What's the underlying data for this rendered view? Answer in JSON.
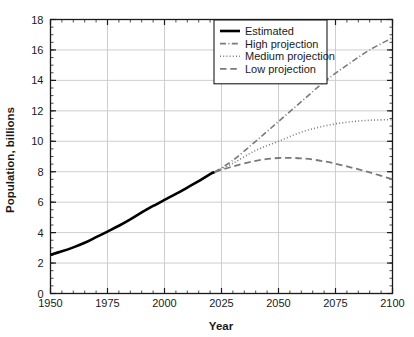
{
  "chart_data": {
    "type": "line",
    "title": "",
    "xlabel": "Year",
    "ylabel": "Population, billions",
    "xlim": [
      1950,
      2100
    ],
    "ylim": [
      0,
      18
    ],
    "xticks": [
      1950,
      1975,
      2000,
      2025,
      2050,
      2075,
      2100
    ],
    "xtick_labels": [
      "1950",
      "1975",
      "2000",
      "2025",
      "2050",
      "2075",
      "2100"
    ],
    "xminor_step": 5,
    "yticks": [
      0,
      2,
      4,
      6,
      8,
      10,
      12,
      14,
      16,
      18
    ],
    "ytick_labels": [
      "0",
      "2",
      "4",
      "6",
      "8",
      "10",
      "12",
      "14",
      "16",
      "18"
    ],
    "yminor_step": 0.5,
    "grid": true,
    "grid_color": "#c8c8c8",
    "legend_position": "top-center-right",
    "series": [
      {
        "name": "Estimated",
        "style": "solid",
        "color": "#000000",
        "width": 2.6,
        "x": [
          1950,
          1955,
          1960,
          1965,
          1970,
          1975,
          1980,
          1985,
          1990,
          1995,
          2000,
          2005,
          2010,
          2015,
          2020,
          2022
        ],
        "values": [
          2.54,
          2.77,
          3.03,
          3.33,
          3.7,
          4.07,
          4.45,
          4.87,
          5.33,
          5.75,
          6.15,
          6.54,
          6.96,
          7.38,
          7.84,
          7.98
        ]
      },
      {
        "name": "High projection",
        "style": "dashdot",
        "color": "#7a7a7a",
        "width": 1.6,
        "x": [
          2022,
          2030,
          2040,
          2050,
          2060,
          2070,
          2080,
          2090,
          2100
        ],
        "values": [
          7.98,
          8.75,
          10.0,
          11.3,
          12.6,
          13.9,
          15.0,
          16.0,
          16.8
        ]
      },
      {
        "name": "Medium projection",
        "style": "dotted",
        "color": "#7a7a7a",
        "width": 1.6,
        "x": [
          2022,
          2030,
          2040,
          2050,
          2060,
          2070,
          2080,
          2090,
          2100
        ],
        "values": [
          7.98,
          8.55,
          9.4,
          10.0,
          10.6,
          11.0,
          11.25,
          11.38,
          11.42
        ]
      },
      {
        "name": "Low projection",
        "style": "dashed",
        "color": "#7a7a7a",
        "width": 1.8,
        "x": [
          2022,
          2030,
          2040,
          2050,
          2060,
          2070,
          2080,
          2090,
          2100
        ],
        "values": [
          7.98,
          8.35,
          8.72,
          8.9,
          8.88,
          8.68,
          8.35,
          7.95,
          7.5
        ]
      }
    ],
    "legend_entries": [
      {
        "label": "Estimated",
        "style": "solid",
        "color": "#000000",
        "width": 2.6
      },
      {
        "label": "High projection",
        "style": "dashdot",
        "color": "#7a7a7a",
        "width": 1.6
      },
      {
        "label": "Medium projection",
        "style": "dotted",
        "color": "#7a7a7a",
        "width": 1.6
      },
      {
        "label": "Low projection",
        "style": "dashed",
        "color": "#7a7a7a",
        "width": 1.8
      }
    ]
  },
  "axes": {
    "x_title": "Year",
    "y_title": "Population, billions"
  },
  "colors": {
    "axis": "#1a1a1a",
    "grid": "#c8c8c8",
    "estimated": "#000000",
    "projection": "#7a7a7a",
    "background": "#ffffff"
  }
}
